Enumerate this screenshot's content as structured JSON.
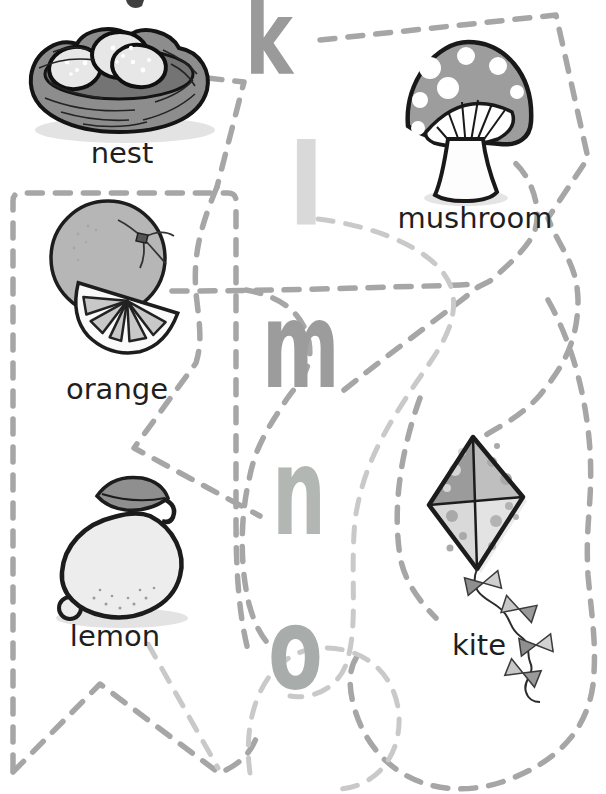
{
  "worksheet": {
    "type": "letter-picture matching tracing worksheet",
    "letters": [
      {
        "char": "k",
        "color": "#9a9a9a"
      },
      {
        "char": "l",
        "color": "#d9d9d9"
      },
      {
        "char": "m",
        "color": "#9c9c9c"
      },
      {
        "char": "n",
        "color": "#b3b7b3"
      },
      {
        "char": "o",
        "color": "#a8acab"
      }
    ],
    "pictures": [
      {
        "name": "nest",
        "label": "nest"
      },
      {
        "name": "mushroom",
        "label": "mushroom"
      },
      {
        "name": "orange",
        "label": "orange"
      },
      {
        "name": "lemon",
        "label": "lemon"
      },
      {
        "name": "kite",
        "label": "kite"
      }
    ],
    "lines": {
      "style": "dashed",
      "medium_color": "#a6a6a6",
      "light_color": "#c9c9c9"
    }
  }
}
